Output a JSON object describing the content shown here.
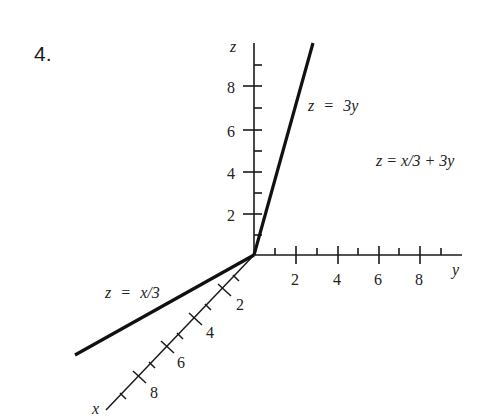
{
  "problem_number": "4.",
  "axes": {
    "z": {
      "label": "z",
      "ticks": [
        "2",
        "4",
        "6",
        "8"
      ]
    },
    "y": {
      "label": "y",
      "ticks": [
        "2",
        "4",
        "6",
        "8"
      ]
    },
    "x": {
      "label": "x",
      "ticks": [
        "2",
        "4",
        "6",
        "8"
      ]
    }
  },
  "lines": {
    "zy": {
      "label_lhs": "z",
      "label_eq": "=",
      "label_rhs": "3y"
    },
    "zx": {
      "label_lhs": "z",
      "label_eq": "=",
      "label_rhs": "x/3"
    }
  },
  "plane": {
    "label": "z = x/3 + 3y"
  },
  "colors": {
    "ink": "#1a1a1a",
    "background": "#ffffff"
  }
}
